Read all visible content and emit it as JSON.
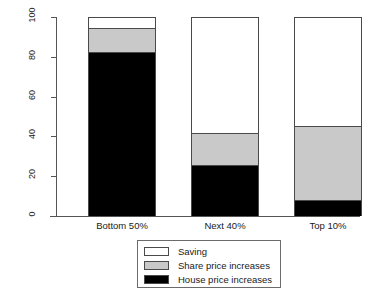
{
  "chart_data": {
    "type": "bar",
    "stacked": true,
    "title": "",
    "subtitle": "",
    "xlabel": "",
    "ylabel": "Contribution to wealth growth (%)",
    "ylim": [
      0,
      100
    ],
    "yticks": [
      0,
      20,
      40,
      60,
      80,
      100
    ],
    "ytick_labels": [
      "0",
      "20",
      "40",
      "60",
      "80",
      "100"
    ],
    "grid": false,
    "legend_position": "bottom-center",
    "categories": [
      "Bottom 50%",
      "Next 40%",
      "Top 10%"
    ],
    "series": [
      {
        "name": "House price increases",
        "color": "#000000",
        "values": [
          82,
          25,
          7.5
        ]
      },
      {
        "name": "Share price increases",
        "color": "#c9c9c9",
        "values": [
          12,
          16,
          37
        ]
      },
      {
        "name": "Saving",
        "color": "#ffffff",
        "values": [
          6,
          59,
          55.5
        ]
      }
    ],
    "stack_order_bottom_to_top": [
      "House price increases",
      "Share price increases",
      "Saving"
    ]
  },
  "axes": {
    "y_title": "Contribution to wealth growth (%)",
    "y_ticks": [
      {
        "label": "100",
        "value": 100
      },
      {
        "label": "80",
        "value": 80
      },
      {
        "label": "60",
        "value": 60
      },
      {
        "label": "40",
        "value": 40
      },
      {
        "label": "20",
        "value": 20
      },
      {
        "label": "0",
        "value": 0
      }
    ],
    "x_labels": [
      "Bottom 50%",
      "Next 40%",
      "Top 10%"
    ]
  },
  "legend": {
    "items": [
      {
        "label": "Saving",
        "color": "#ffffff"
      },
      {
        "label": "Share price increases",
        "color": "#c9c9c9"
      },
      {
        "label": "House price increases",
        "color": "#000000"
      }
    ]
  }
}
